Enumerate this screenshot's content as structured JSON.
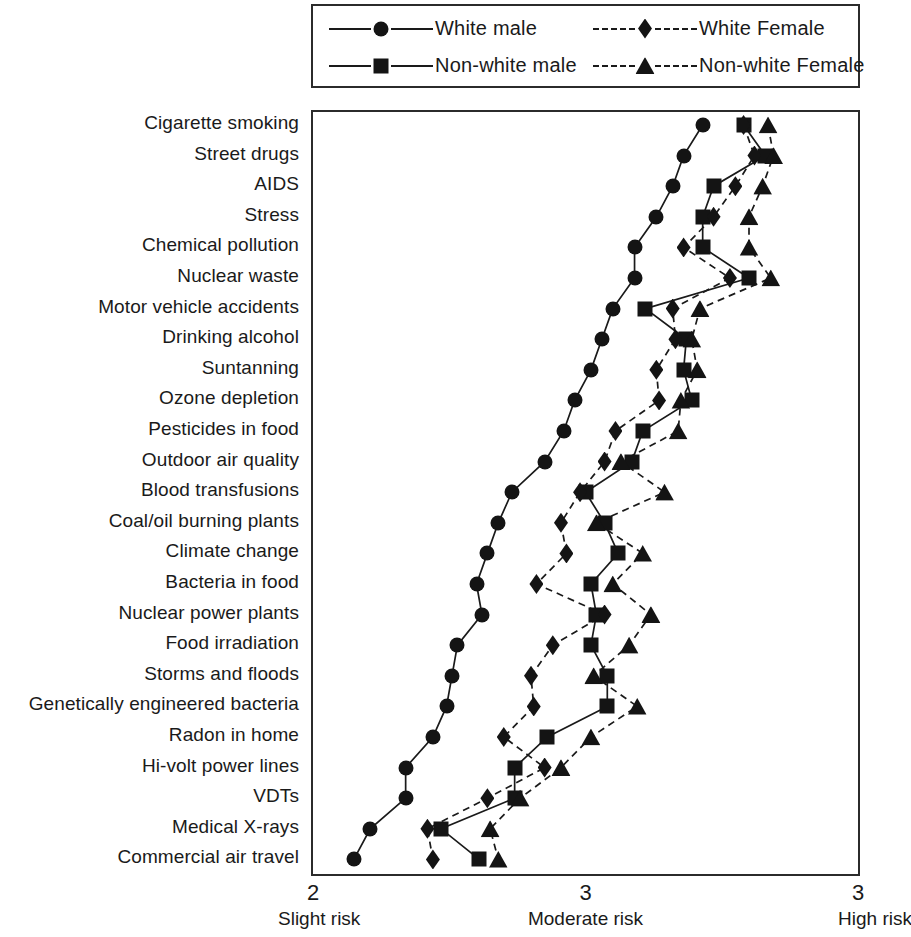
{
  "legend": {
    "entries": [
      {
        "label": "White male",
        "marker": "circle",
        "line": "solid"
      },
      {
        "label": "White Female",
        "marker": "diamond",
        "line": "dashed"
      },
      {
        "label": "Non-white male",
        "marker": "square",
        "line": "solid"
      },
      {
        "label": "Non-white Female",
        "marker": "triangle",
        "line": "dashed"
      }
    ]
  },
  "axis": {
    "x_ticks": [
      {
        "value": 2,
        "label": "2",
        "caption": "Slight risk"
      },
      {
        "value": 3,
        "label": "3",
        "caption": "Moderate risk"
      },
      {
        "value": 4,
        "label": "3",
        "caption": "High risk"
      }
    ]
  },
  "chart_data": {
    "type": "line",
    "title": "",
    "xlabel": "",
    "ylabel": "",
    "xlim": [
      2,
      4
    ],
    "grid": false,
    "legend_position": "top",
    "orientation": "horizontal",
    "categories": [
      "Cigarette smoking",
      "Street drugs",
      "AIDS",
      "Stress",
      "Chemical pollution",
      "Nuclear waste",
      "Motor vehicle accidents",
      "Drinking alcohol",
      "Suntanning",
      "Ozone depletion",
      "Pesticides in food",
      "Outdoor air quality",
      "Blood transfusions",
      "Coal/oil burning plants",
      "Climate change",
      "Bacteria in food",
      "Nuclear power plants",
      "Food irradiation",
      "Storms and floods",
      "Genetically engineered bacteria",
      "Radon in home",
      "Hi-volt power lines",
      "VDTs",
      "Medical X-rays",
      "Commercial air travel"
    ],
    "series": [
      {
        "name": "White male",
        "marker": "circle",
        "line": "solid",
        "values": [
          3.43,
          3.36,
          3.32,
          3.26,
          3.18,
          3.18,
          3.1,
          3.06,
          3.02,
          2.96,
          2.92,
          2.85,
          2.73,
          2.68,
          2.64,
          2.6,
          2.62,
          2.53,
          2.51,
          2.49,
          2.44,
          2.34,
          2.34,
          2.21,
          2.15
        ]
      },
      {
        "name": "Non-white male",
        "marker": "square",
        "line": "solid",
        "values": [
          3.58,
          3.66,
          3.47,
          3.43,
          3.43,
          3.6,
          3.22,
          3.37,
          3.36,
          3.39,
          3.21,
          3.17,
          3.0,
          3.07,
          3.12,
          3.02,
          3.04,
          3.02,
          3.08,
          3.08,
          2.86,
          2.74,
          2.74,
          2.47,
          2.61
        ]
      },
      {
        "name": "White Female",
        "marker": "diamond",
        "line": "dashed",
        "values": [
          3.58,
          3.62,
          3.55,
          3.47,
          3.36,
          3.53,
          3.32,
          3.33,
          3.26,
          3.27,
          3.11,
          3.07,
          2.98,
          2.91,
          2.93,
          2.82,
          3.07,
          2.88,
          2.8,
          2.81,
          2.7,
          2.85,
          2.64,
          2.42,
          2.44
        ]
      },
      {
        "name": "Non-white Female",
        "marker": "triangle",
        "line": "dashed",
        "values": [
          3.67,
          3.69,
          3.65,
          3.6,
          3.6,
          3.68,
          3.42,
          3.39,
          3.41,
          3.35,
          3.34,
          3.13,
          3.29,
          3.04,
          3.21,
          3.1,
          3.24,
          3.16,
          3.03,
          3.19,
          3.02,
          2.91,
          2.76,
          2.65,
          2.68
        ]
      }
    ]
  }
}
